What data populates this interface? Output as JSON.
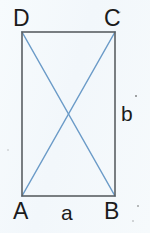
{
  "figure": {
    "kind": "geometry-diagram",
    "shape_name": "rectangle",
    "background_color": "#f4f8fb",
    "outline_color": "#5a5f63",
    "diagonal_color": "#6b9bc8",
    "label_color": "#1b1b1b",
    "vertices": [
      {
        "id": "D",
        "label": "D",
        "position": "top-left",
        "x": 22,
        "y": 32
      },
      {
        "id": "C",
        "label": "C",
        "position": "top-right",
        "x": 115,
        "y": 32
      },
      {
        "id": "B",
        "label": "B",
        "position": "bottom-right",
        "x": 115,
        "y": 196
      },
      {
        "id": "A",
        "label": "A",
        "position": "bottom-left",
        "x": 22,
        "y": 196
      }
    ],
    "sides": [
      {
        "id": "a",
        "label": "a",
        "edge": "AB",
        "orientation": "horizontal",
        "description": "bottom side, width"
      },
      {
        "id": "b",
        "label": "b",
        "edge": "BC",
        "orientation": "vertical",
        "description": "right side, height"
      }
    ],
    "diagonals": [
      {
        "id": "AC",
        "from": "A",
        "to": "C"
      },
      {
        "id": "DB",
        "from": "D",
        "to": "B"
      }
    ],
    "intersection": {
      "label": "",
      "x": 68,
      "y": 114
    }
  }
}
